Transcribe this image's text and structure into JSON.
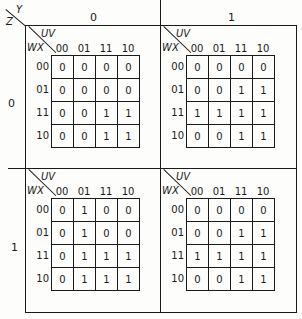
{
  "corner": {
    "top_var": "Y",
    "left_var": "Z"
  },
  "column_values": [
    "0",
    "1"
  ],
  "row_values": [
    "0",
    "1"
  ],
  "kmap_axes": {
    "col_var": "UV",
    "row_var": "WX",
    "col_labels": [
      "00",
      "01",
      "11",
      "10"
    ],
    "row_labels": [
      "00",
      "01",
      "11",
      "10"
    ]
  },
  "maps": [
    {
      "y": "0",
      "z": "0",
      "cells": [
        [
          "0",
          "0",
          "0",
          "0"
        ],
        [
          "0",
          "0",
          "0",
          "0"
        ],
        [
          "0",
          "0",
          "1",
          "1"
        ],
        [
          "0",
          "0",
          "1",
          "1"
        ]
      ]
    },
    {
      "y": "1",
      "z": "0",
      "cells": [
        [
          "0",
          "0",
          "0",
          "0"
        ],
        [
          "0",
          "0",
          "1",
          "1"
        ],
        [
          "1",
          "1",
          "1",
          "1"
        ],
        [
          "0",
          "0",
          "1",
          "1"
        ]
      ]
    },
    {
      "y": "0",
      "z": "1",
      "cells": [
        [
          "0",
          "1",
          "0",
          "0"
        ],
        [
          "0",
          "1",
          "0",
          "0"
        ],
        [
          "0",
          "1",
          "1",
          "1"
        ],
        [
          "0",
          "1",
          "1",
          "1"
        ]
      ]
    },
    {
      "y": "1",
      "z": "1",
      "cells": [
        [
          "0",
          "0",
          "0",
          "0"
        ],
        [
          "0",
          "0",
          "1",
          "1"
        ],
        [
          "1",
          "1",
          "1",
          "1"
        ],
        [
          "0",
          "0",
          "1",
          "1"
        ]
      ]
    }
  ]
}
